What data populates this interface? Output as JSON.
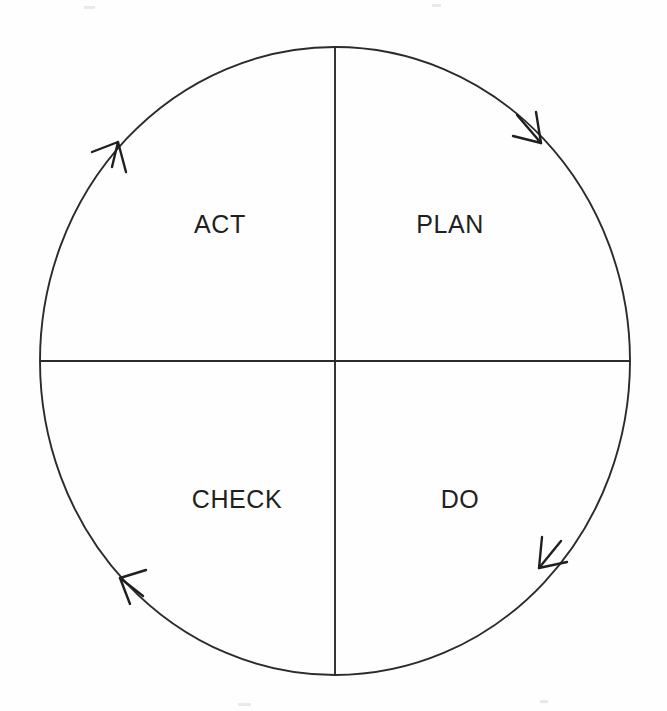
{
  "diagram": {
    "type": "cycle-diagram",
    "direction": "clockwise",
    "background_color": "#fefefe",
    "stroke_color": "#2b2b2b",
    "text_color": "#231f20",
    "circle": {
      "center_x": 335,
      "center_y": 361,
      "radius_x": 295,
      "radius_y": 314
    },
    "quadrants": [
      {
        "id": "plan",
        "label": "PLAN",
        "position": "top-right",
        "label_x": 450,
        "label_y": 233
      },
      {
        "id": "act",
        "label": "ACT",
        "position": "top-left",
        "label_x": 220,
        "label_y": 233
      },
      {
        "id": "do",
        "label": "DO",
        "position": "bottom-right",
        "label_x": 460,
        "label_y": 508
      },
      {
        "id": "check",
        "label": "CHECK",
        "position": "bottom-left",
        "label_x": 237,
        "label_y": 508
      }
    ],
    "dividers": [
      {
        "id": "horizontal-divider",
        "x1": 40,
        "y1": 361,
        "x2": 630,
        "y2": 361
      },
      {
        "id": "vertical-divider",
        "x1": 335,
        "y1": 47,
        "x2": 335,
        "y2": 675
      }
    ],
    "arrowheads": [
      {
        "id": "arrow-plan",
        "quadrant": "plan",
        "tip_x": 543,
        "tip_y": 141,
        "angle_deg": 140,
        "points": "clockwise-down-right"
      },
      {
        "id": "arrow-do",
        "quadrant": "do",
        "tip_x": 541,
        "tip_y": 565,
        "angle_deg": 222,
        "points": "clockwise-down-left"
      },
      {
        "id": "arrow-check",
        "quadrant": "check",
        "tip_x": 122,
        "tip_y": 578,
        "angle_deg": 315,
        "points": "clockwise-up-left"
      },
      {
        "id": "arrow-act",
        "quadrant": "act",
        "tip_x": 115,
        "tip_y": 142,
        "angle_deg": 40,
        "points": "clockwise-up-right"
      }
    ]
  }
}
